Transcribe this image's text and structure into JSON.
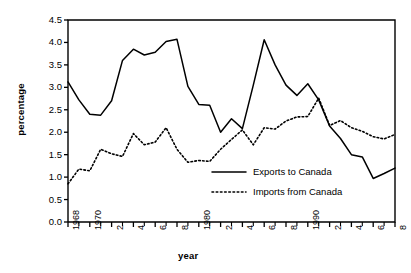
{
  "chart_data": {
    "type": "line",
    "title": "",
    "xlabel": "year",
    "ylabel": "percentage",
    "xlim": [
      1968,
      1998
    ],
    "ylim": [
      0.0,
      4.5
    ],
    "grid": false,
    "legend_position": "center-right",
    "ytick_labels": [
      "4.5",
      "4.0",
      "3.5",
      "3.0",
      "2.5",
      "2.0",
      "1.5",
      "1.0",
      "0.5",
      "0.0"
    ],
    "ytick_values": [
      4.5,
      4.0,
      3.5,
      3.0,
      2.5,
      2.0,
      1.5,
      1.0,
      0.5,
      0.0
    ],
    "xtick_values": [
      1968,
      1970,
      1972,
      1974,
      1976,
      1978,
      1980,
      1982,
      1984,
      1986,
      1988,
      1990,
      1992,
      1994,
      1996,
      1998
    ],
    "xtick_labels": [
      "1968",
      "1970",
      "2",
      "4",
      "6",
      "8",
      "1980",
      "2",
      "4",
      "6",
      "8",
      "1990",
      "2",
      "4",
      "6",
      "8"
    ],
    "xtick_minor_values": [
      1969,
      1971,
      1973,
      1975,
      1977,
      1979,
      1981,
      1983,
      1985,
      1987,
      1989,
      1991,
      1993,
      1995,
      1997
    ],
    "x": [
      1968,
      1969,
      1970,
      1971,
      1972,
      1973,
      1974,
      1975,
      1976,
      1977,
      1978,
      1979,
      1980,
      1981,
      1982,
      1983,
      1984,
      1985,
      1986,
      1987,
      1988,
      1989,
      1990,
      1991,
      1992,
      1993,
      1994,
      1995,
      1996,
      1997,
      1998
    ],
    "series": [
      {
        "name": "Exports to Canada",
        "style": "solid",
        "color": "#000000",
        "values": [
          3.12,
          2.72,
          2.4,
          2.38,
          2.7,
          3.6,
          3.85,
          3.72,
          3.78,
          4.02,
          4.07,
          3.02,
          2.62,
          2.6,
          2.0,
          2.3,
          2.08,
          3.05,
          4.06,
          3.5,
          3.05,
          2.82,
          3.08,
          2.72,
          2.14,
          1.86,
          1.5,
          1.45,
          0.97,
          1.08,
          1.2
        ]
      },
      {
        "name": "Imports from Canada",
        "style": "dotted",
        "color": "#000000",
        "values": [
          0.85,
          1.18,
          1.14,
          1.62,
          1.52,
          1.46,
          1.97,
          1.72,
          1.78,
          2.1,
          1.62,
          1.33,
          1.37,
          1.35,
          1.62,
          1.84,
          2.05,
          1.72,
          2.1,
          2.07,
          2.25,
          2.34,
          2.35,
          2.76,
          2.15,
          2.26,
          2.1,
          2.02,
          1.9,
          1.85,
          1.95
        ]
      }
    ]
  },
  "legend": {
    "items": [
      {
        "label": "Exports to Canada"
      },
      {
        "label": "Imports from Canada"
      }
    ]
  },
  "axis_titles": {
    "y": "percentage",
    "x": "year"
  }
}
